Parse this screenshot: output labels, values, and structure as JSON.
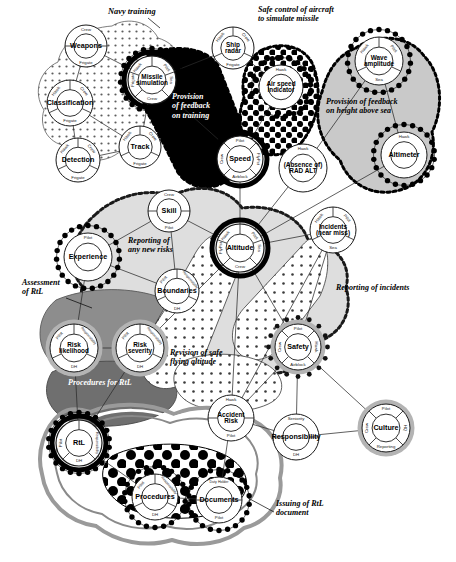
{
  "diagram": {
    "background": "#ffffff"
  },
  "palette": {
    "black": "#000000",
    "white": "#ffffff",
    "dark_grey": "#6f6f6f",
    "mid_grey": "#9a9a9a",
    "light_grey": "#c9c9c9",
    "pale_grey": "#e3e3e3",
    "very_pale": "#efefef",
    "line": "#2b2b2b"
  },
  "regions": [
    {
      "id": "navy-training",
      "label": "Navy training",
      "fill": "#ffffff",
      "pattern": "fine-dots",
      "border": "solid"
    },
    {
      "id": "provision-of-feedback-on-training",
      "label": "Provision of feedback on training",
      "fill": "#000000",
      "pattern": "solid-black",
      "border": "bead-dashed",
      "label_color": "#ffffff"
    },
    {
      "id": "safe-control-of-aircraft",
      "label": "Safe control of aircraft to simulate missile",
      "fill": "#ffffff",
      "pattern": "checker",
      "border": "bead-dashed"
    },
    {
      "id": "provision-of-feedback-on-height",
      "label": "Provision of feedback on height above sea",
      "fill": "#c9c9c9",
      "pattern": "solid",
      "border": "bead-dashed"
    },
    {
      "id": "reporting-of-any-new-risks",
      "label": "Reporting of any new risks",
      "fill": "#dedede",
      "pattern": "solid",
      "border": "bead-dashed"
    },
    {
      "id": "assessment-of-rtl",
      "label": "Assessment of RtL",
      "fill": "#8d8d8d",
      "pattern": "solid",
      "border": "solid"
    },
    {
      "id": "reporting-of-incidents",
      "label": "Reporting of incidents",
      "fill": "#ffffff",
      "pattern": "open-dots",
      "border": "solid"
    },
    {
      "id": "revision-of-safe-flying-altitude",
      "label": "Revision of safe flying altitude",
      "fill": "#ffffff",
      "pattern": "open-dots",
      "border": "solid"
    },
    {
      "id": "procedures-for-rtl",
      "label": "Procedures for RtL",
      "fill": "#6f6f6f",
      "pattern": "solid",
      "border": "solid"
    },
    {
      "id": "issuing-of-rtl-document",
      "label": "Issuing of RtL document",
      "fill": "#ffffff",
      "pattern": "big-dots",
      "border": "layered-rings"
    }
  ],
  "annotations": [
    {
      "id": "navy-training",
      "text": "Navy training",
      "x": 108,
      "y": 14,
      "color": "#000000",
      "size": 8.4,
      "leader": [
        [
          148,
          18
        ],
        [
          160,
          28
        ]
      ]
    },
    {
      "id": "provision-of-feedback-on-training",
      "text": "Provision\nof feedback\non training",
      "x": 172,
      "y": 99,
      "color": "#ffffff",
      "size": 8.0
    },
    {
      "id": "safe-control-of-aircraft",
      "text": "Safe control of aircraft\nto simulate missile",
      "x": 258,
      "y": 12,
      "color": "#000000",
      "size": 8.0
    },
    {
      "id": "provision-of-feedback-on-height",
      "text": "Provision of feedback\non height above sea",
      "x": 326,
      "y": 104,
      "color": "#000000",
      "size": 8.0
    },
    {
      "id": "reporting-of-any-new-risks",
      "text": "Reporting of\nany new risks",
      "x": 128,
      "y": 243,
      "color": "#000000",
      "size": 8.0
    },
    {
      "id": "assessment-of-rtl",
      "text": "Assessment\nof RtL",
      "x": 22,
      "y": 285,
      "color": "#000000",
      "size": 8.0,
      "leader": [
        [
          66,
          298
        ],
        [
          92,
          308
        ]
      ]
    },
    {
      "id": "reporting-of-incidents",
      "text": "Reporting of incidents",
      "x": 336,
      "y": 290,
      "color": "#000000",
      "size": 8.0
    },
    {
      "id": "revision-of-safe-flying-altitude",
      "text": "Revision of safe\nflying altitude",
      "x": 170,
      "y": 355,
      "color": "#000000",
      "size": 8.0
    },
    {
      "id": "procedures-for-rtl",
      "text": "Procedures for RtL",
      "x": 68,
      "y": 385,
      "color": "#ffffff",
      "size": 8.0
    },
    {
      "id": "issuing-of-rtl-document",
      "text": "Issuing of RtL\ndocument",
      "x": 276,
      "y": 506,
      "color": "#000000",
      "size": 8.0,
      "leader": [
        [
          274,
          512
        ],
        [
          248,
          498
        ]
      ]
    }
  ],
  "nodes": [
    {
      "id": "weapons",
      "label": "Weapons",
      "x": 86,
      "y": 46,
      "r": 21,
      "ring": "plain",
      "segments": [
        {
          "label": "Crew",
          "pos": "top"
        },
        {
          "label": "Frigate",
          "pos": "bottom"
        }
      ]
    },
    {
      "id": "classification",
      "label": "Classification",
      "x": 70,
      "y": 103,
      "r": 23,
      "ring": "plain",
      "segments": [
        {
          "label": "Hawk",
          "pos": "top-left"
        },
        {
          "label": "Crew",
          "pos": "top-right"
        },
        {
          "label": "Frigate",
          "pos": "bottom"
        }
      ]
    },
    {
      "id": "detection",
      "label": "Detection",
      "x": 78,
      "y": 160,
      "r": 22,
      "ring": "plain",
      "segments": [
        {
          "label": "Hawk",
          "pos": "top-left"
        },
        {
          "label": "Crew",
          "pos": "top-right"
        },
        {
          "label": "Frigate",
          "pos": "bottom"
        }
      ]
    },
    {
      "id": "track",
      "label": "Track",
      "x": 140,
      "y": 147,
      "r": 21,
      "ring": "plain",
      "segments": [
        {
          "label": "Hawk",
          "pos": "top-left"
        },
        {
          "label": "Crew",
          "pos": "top-right"
        },
        {
          "label": "Frigate",
          "pos": "bottom"
        }
      ]
    },
    {
      "id": "missile-simulation",
      "label": "Missile\nsimulation",
      "x": 152,
      "y": 80,
      "r": 24,
      "ring": "heavy-black-bead",
      "segments": [
        {
          "label": "Hawk",
          "pos": "top-left"
        },
        {
          "label": "Pilot",
          "pos": "top-right"
        },
        {
          "label": "Frigate",
          "pos": "left"
        },
        {
          "label": "Sea",
          "pos": "right"
        },
        {
          "label": "Crew",
          "pos": "bottom"
        }
      ]
    },
    {
      "id": "ship-radar",
      "label": "Ship\nradar",
      "x": 233,
      "y": 48,
      "r": 21,
      "ring": "plain",
      "segments": [
        {
          "label": "Hawk",
          "pos": "top-left"
        },
        {
          "label": "Crew",
          "pos": "top-right"
        },
        {
          "label": "Frigate",
          "pos": "bottom"
        }
      ]
    },
    {
      "id": "air-speed-indicator",
      "label": "Air speed\nindicator",
      "x": 281,
      "y": 87,
      "r": 22,
      "ring": "bead",
      "segments": [
        {
          "label": "Hawk",
          "pos": "top"
        }
      ]
    },
    {
      "id": "wave-amplitude",
      "label": "Wave\namplitude",
      "x": 379,
      "y": 61,
      "r": 24,
      "ring": "bead",
      "segments": [
        {
          "label": "Hawk",
          "pos": "top-left"
        },
        {
          "label": "Pilot",
          "pos": "top-right"
        },
        {
          "label": "Sea",
          "pos": "bottom"
        }
      ]
    },
    {
      "id": "altimeter",
      "label": "Altimeter",
      "x": 404,
      "y": 155,
      "r": 23,
      "ring": "bead",
      "segments": [
        {
          "label": "Hawk",
          "pos": "top"
        }
      ]
    },
    {
      "id": "speed",
      "label": "Speed",
      "x": 240,
      "y": 159,
      "r": 23,
      "ring": "heavy-black",
      "segments": [
        {
          "label": "Pilot",
          "pos": "top"
        },
        {
          "label": "Crew",
          "pos": "left"
        },
        {
          "label": "FlyPst",
          "pos": "right"
        },
        {
          "label": "Airblock",
          "pos": "bottom"
        }
      ]
    },
    {
      "id": "absence-of-rad-alt",
      "label": "(Absence of)\nRAD ALT",
      "x": 303,
      "y": 168,
      "r": 24,
      "ring": "plain",
      "segments": [
        {
          "label": "Hawk",
          "pos": "top"
        }
      ]
    },
    {
      "id": "altitude",
      "label": "Altitude",
      "x": 240,
      "y": 248,
      "r": 24,
      "ring": "heavy-black",
      "segments": [
        {
          "label": "Hawk",
          "pos": "top-left"
        },
        {
          "label": "Pilot",
          "pos": "top-right"
        },
        {
          "label": "FlyPst",
          "pos": "left"
        },
        {
          "label": "Sea",
          "pos": "right"
        },
        {
          "label": "Crew",
          "pos": "bottom"
        }
      ]
    },
    {
      "id": "skill",
      "label": "Skill",
      "x": 169,
      "y": 211,
      "r": 21,
      "ring": "plain",
      "segments": [
        {
          "label": "Crew",
          "pos": "top"
        },
        {
          "label": "Pilot",
          "pos": "bottom"
        }
      ]
    },
    {
      "id": "experience",
      "label": "Experience",
      "x": 88,
      "y": 257,
      "r": 24,
      "ring": "bead",
      "segments": [
        {
          "label": "Pilot",
          "pos": "top"
        }
      ]
    },
    {
      "id": "boundaries",
      "label": "Boundaries",
      "x": 177,
      "y": 291,
      "r": 22,
      "ring": "plain",
      "segments": [
        {
          "label": "Pilot",
          "pos": "top-left"
        },
        {
          "label": "Responsibility",
          "pos": "top-right"
        },
        {
          "label": "DH",
          "pos": "bottom"
        }
      ]
    },
    {
      "id": "incidents-near-miss",
      "label": "Incidents\n(near miss)",
      "x": 333,
      "y": 230,
      "r": 23,
      "ring": "plain",
      "segments": [
        {
          "label": "Hawk",
          "pos": "top-left"
        },
        {
          "label": "Pilot",
          "pos": "top-right"
        },
        {
          "label": "Sea",
          "pos": "bottom"
        }
      ]
    },
    {
      "id": "risk-likelihood",
      "label": "Risk\nlikelihood",
      "x": 74,
      "y": 348,
      "r": 24,
      "ring": "grey-halo",
      "segments": [
        {
          "label": "Pilot",
          "pos": "top-left"
        },
        {
          "label": "Responsibility",
          "pos": "top-right"
        },
        {
          "label": "DH",
          "pos": "bottom"
        }
      ]
    },
    {
      "id": "risk-severity",
      "label": "Risk\nseverity",
      "x": 140,
      "y": 348,
      "r": 24,
      "ring": "grey-halo",
      "segments": [
        {
          "label": "Pilot",
          "pos": "top-left"
        },
        {
          "label": "Responsibility",
          "pos": "top-right"
        },
        {
          "label": "DH",
          "pos": "bottom"
        }
      ]
    },
    {
      "id": "safety",
      "label": "Safety",
      "x": 298,
      "y": 347,
      "r": 23,
      "ring": "grey-bead",
      "segments": [
        {
          "label": "Pilot",
          "pos": "top"
        },
        {
          "label": "Crew",
          "pos": "left"
        },
        {
          "label": "Hawk",
          "pos": "right"
        },
        {
          "label": "Airblock",
          "pos": "bottom"
        }
      ]
    },
    {
      "id": "accident-risk",
      "label": "Accident\nRisk",
      "x": 231,
      "y": 418,
      "r": 23,
      "ring": "plain",
      "segments": [
        {
          "label": "Hawk",
          "pos": "top"
        },
        {
          "label": "Pilot",
          "pos": "bottom"
        }
      ]
    },
    {
      "id": "responsibility",
      "label": "Responsibility",
      "x": 296,
      "y": 437,
      "r": 23,
      "ring": "plain",
      "segments": [
        {
          "label": "Seniority",
          "pos": "top"
        },
        {
          "label": "DH",
          "pos": "bottom"
        }
      ]
    },
    {
      "id": "culture",
      "label": "Culture",
      "x": 386,
      "y": 428,
      "r": 24,
      "ring": "grey-halo",
      "segments": [
        {
          "label": "Pilot",
          "pos": "top"
        },
        {
          "label": "Crew",
          "pos": "left"
        },
        {
          "label": "HQ",
          "pos": "right"
        },
        {
          "label": "Reporting",
          "pos": "bottom"
        }
      ]
    },
    {
      "id": "rtl",
      "label": "RtL",
      "x": 79,
      "y": 443,
      "r": 23,
      "ring": "heavy-black-bead",
      "segments": [
        {
          "label": "Pilot",
          "pos": "left"
        },
        {
          "label": "Responsibility",
          "pos": "right"
        },
        {
          "label": "DH",
          "pos": "bottom"
        }
      ]
    },
    {
      "id": "procedures",
      "label": "Procedures",
      "x": 155,
      "y": 497,
      "r": 23,
      "ring": "bead",
      "segments": [
        {
          "label": "Pilot",
          "pos": "top-left"
        },
        {
          "label": "Responsibility",
          "pos": "top-right"
        },
        {
          "label": "DH",
          "pos": "bottom"
        }
      ]
    },
    {
      "id": "documents",
      "label": "Documents",
      "x": 219,
      "y": 500,
      "r": 23,
      "ring": "bead",
      "segments": [
        {
          "label": "Duty Holder",
          "pos": "top"
        },
        {
          "label": "Pilot",
          "pos": "bottom"
        }
      ]
    }
  ],
  "links": [
    {
      "from": "weapons",
      "to": "classification"
    },
    {
      "from": "weapons",
      "to": "missile-simulation"
    },
    {
      "from": "classification",
      "to": "detection"
    },
    {
      "from": "classification",
      "to": "track"
    },
    {
      "from": "detection",
      "to": "track"
    },
    {
      "from": "track",
      "to": "missile-simulation"
    },
    {
      "from": "missile-simulation",
      "to": "ship-radar"
    },
    {
      "from": "missile-simulation",
      "to": "speed"
    },
    {
      "from": "ship-radar",
      "to": "air-speed-indicator"
    },
    {
      "from": "air-speed-indicator",
      "to": "speed"
    },
    {
      "from": "wave-amplitude",
      "to": "altimeter"
    },
    {
      "from": "wave-amplitude",
      "to": "absence-of-rad-alt"
    },
    {
      "from": "altimeter",
      "to": "altitude"
    },
    {
      "from": "absence-of-rad-alt",
      "to": "altitude"
    },
    {
      "from": "speed",
      "to": "altitude"
    },
    {
      "from": "skill",
      "to": "altitude"
    },
    {
      "from": "skill",
      "to": "experience"
    },
    {
      "from": "skill",
      "to": "boundaries"
    },
    {
      "from": "experience",
      "to": "boundaries"
    },
    {
      "from": "experience",
      "to": "risk-likelihood"
    },
    {
      "from": "boundaries",
      "to": "risk-severity"
    },
    {
      "from": "altitude",
      "to": "incidents-near-miss"
    },
    {
      "from": "altitude",
      "to": "safety"
    },
    {
      "from": "incidents-near-miss",
      "to": "safety"
    },
    {
      "from": "incidents-near-miss",
      "to": "accident-risk"
    },
    {
      "from": "risk-likelihood",
      "to": "risk-severity"
    },
    {
      "from": "risk-likelihood",
      "to": "rtl"
    },
    {
      "from": "risk-severity",
      "to": "rtl"
    },
    {
      "from": "safety",
      "to": "responsibility"
    },
    {
      "from": "safety",
      "to": "culture"
    },
    {
      "from": "accident-risk",
      "to": "responsibility"
    },
    {
      "from": "responsibility",
      "to": "culture"
    },
    {
      "from": "rtl",
      "to": "procedures"
    },
    {
      "from": "procedures",
      "to": "documents"
    },
    {
      "from": "documents",
      "to": "accident-risk"
    },
    {
      "from": "altitude",
      "to": "accident-risk"
    },
    {
      "from": "altitude",
      "to": "risk-severity"
    },
    {
      "from": "safety",
      "to": "accident-risk"
    }
  ]
}
